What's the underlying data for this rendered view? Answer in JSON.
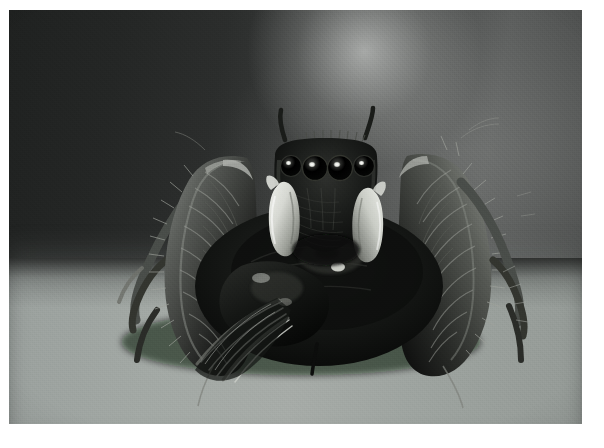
{
  "page": {
    "width": 604,
    "height": 448,
    "matte_color": "#ffffff",
    "kind": "photograph"
  },
  "photo": {
    "title": "Jumping spider facing camera with captured prey",
    "alt_text": "Black-and-white close-up photograph of a hairy jumping spider viewed head-on, its four forward eyes catching the light, pale pedipalps below the face, two tufted setae rising from the top of the carapace, and a dark winged insect held beneath its body on a smooth gray surface.",
    "medium": "black and white photograph",
    "subject": "jumping spider",
    "frame": {
      "left": 9,
      "top": 10,
      "width": 573,
      "height": 414,
      "border_color": "#ffffff"
    },
    "palette": {
      "background_dark": "#1f2120",
      "background_mid": "#4d4f4e",
      "background_highlight": "#bec0be",
      "table_surface": "#a2a8a4",
      "spider_body": "#141514",
      "spider_hair": "#6e716e",
      "pedipalp_white": "#e6e8e4",
      "eye_shine": "#f2f3ef"
    },
    "regions": [
      {
        "name": "upper-wall",
        "description": "dark gray studio backdrop darkening toward the left edge"
      },
      {
        "name": "light-pool",
        "description": "soft bright pool of light in the upper center-right of the backdrop"
      },
      {
        "name": "table-surface",
        "description": "lighter gray tabletop occupying the lower third of the frame"
      },
      {
        "name": "spider",
        "description": "jumping spider centered in the frame, facing the camera"
      },
      {
        "name": "prey",
        "description": "dark winged insect clasped beneath the spider, wings fanning to the lower left"
      }
    ],
    "subject_features": [
      {
        "name": "anterior-median-eyes",
        "count": 2,
        "note": "large forward eyes with bright specular highlights"
      },
      {
        "name": "anterior-lateral-eyes",
        "count": 2,
        "note": "smaller eyes flanking the median pair"
      },
      {
        "name": "carapace-tufts",
        "count": 2,
        "note": "tufted setae rising from the top of the head"
      },
      {
        "name": "pedipalps",
        "count": 2,
        "note": "pale white-banded palps held below the face"
      },
      {
        "name": "front-legs",
        "count": 2,
        "note": "thick, heavily fringed raised front legs"
      },
      {
        "name": "hind-legs",
        "count": 2,
        "note": "slender legs braced outward on the surface"
      }
    ]
  }
}
